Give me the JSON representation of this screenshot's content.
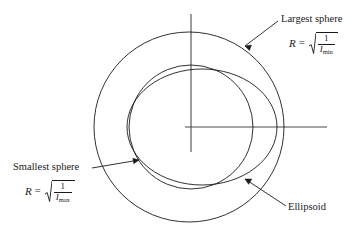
{
  "figure": {
    "type": "geometry-diagram",
    "background_color": "#ffffff",
    "stroke_color": "#1a1a1a",
    "axes": {
      "origin": {
        "x": 191,
        "y": 127
      },
      "vertical": {
        "x": 191,
        "y_top": 14,
        "y_bottom": 152
      },
      "horizontal": {
        "y": 127,
        "x_left": 185,
        "x_right": 327
      }
    },
    "shapes": [
      {
        "name": "largest-sphere",
        "kind": "circle",
        "cx": 189,
        "cy": 127,
        "r": 95,
        "note": "outer circle, radius R = sqrt(1/Imin)"
      },
      {
        "name": "smallest-sphere",
        "kind": "circle",
        "cx": 191,
        "cy": 127,
        "r": 62,
        "note": "inner circle, radius R = sqrt(1/Imax)"
      },
      {
        "name": "ellipsoid",
        "kind": "ellipse",
        "cx": 202,
        "cy": 127,
        "rx": 75,
        "ry": 58,
        "rotation_deg": 0,
        "note": "ellipse tangent between the two spheres"
      }
    ],
    "leaders": [
      {
        "name": "largest-sphere-leader",
        "from": {
          "x": 277,
          "y": 22
        },
        "to": {
          "x": 243,
          "y": 48
        },
        "arrow_at": "to"
      },
      {
        "name": "smallest-sphere-leader",
        "from": {
          "x": 92,
          "y": 168
        },
        "to": {
          "x": 141,
          "y": 160
        },
        "arrow_at": "to"
      },
      {
        "name": "ellipsoid-leader",
        "from": {
          "x": 285,
          "y": 205
        },
        "to": {
          "x": 243,
          "y": 177
        },
        "arrow_at": "to"
      }
    ]
  },
  "labels": {
    "largest_sphere": {
      "text": "Largest sphere",
      "formula": {
        "lhs": "R",
        "equals": "=",
        "numerator": "1",
        "denominator": "I",
        "denominator_sub": "min"
      }
    },
    "smallest_sphere": {
      "text": "Smallest sphere",
      "formula": {
        "lhs": "R",
        "equals": "=",
        "numerator": "1",
        "denominator": "I",
        "denominator_sub": "max"
      }
    },
    "ellipsoid": {
      "text": "Ellipsoid"
    }
  }
}
